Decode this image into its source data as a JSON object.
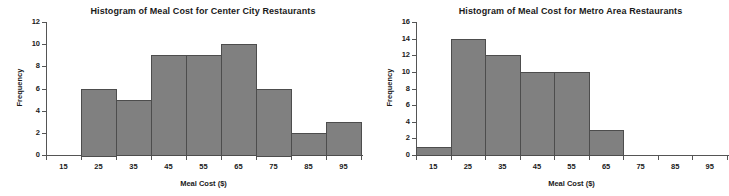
{
  "figure": {
    "panel_count": 2
  },
  "chart_data": [
    {
      "type": "bar",
      "title": "Histogram of Meal Cost for Center City Restaurants",
      "xlabel": "Meal Cost ($)",
      "ylabel": "Frequency",
      "categories": [
        "15",
        "25",
        "35",
        "45",
        "55",
        "65",
        "75",
        "85",
        "95"
      ],
      "bin_edges": [
        10,
        20,
        30,
        40,
        50,
        60,
        70,
        80,
        90,
        100
      ],
      "values": [
        0,
        6,
        5,
        9,
        9,
        10,
        6,
        2,
        3
      ],
      "xlim": [
        10,
        100
      ],
      "ylim": [
        0,
        12
      ],
      "ytick_values": [
        "0",
        "2",
        "4",
        "6",
        "8",
        "10",
        "12"
      ],
      "ytick_step": 2,
      "grid": false,
      "legend": false,
      "bar_color": "#808080",
      "bar_edge_color": "#4d4d4d",
      "axis_color": "#555555"
    },
    {
      "type": "bar",
      "title": "Histogram of Meal Cost for Metro Area Restaurants",
      "xlabel": "Meal Cost ($)",
      "ylabel": "Frequency",
      "categories": [
        "15",
        "25",
        "35",
        "45",
        "55",
        "65",
        "75",
        "85",
        "95"
      ],
      "bin_edges": [
        10,
        20,
        30,
        40,
        50,
        60,
        70,
        80,
        90,
        100
      ],
      "values": [
        1,
        14,
        12,
        10,
        10,
        3,
        0,
        0,
        0
      ],
      "xlim": [
        10,
        100
      ],
      "ylim": [
        0,
        16
      ],
      "ytick_values": [
        "0",
        "2",
        "4",
        "6",
        "8",
        "10",
        "12",
        "14",
        "16"
      ],
      "ytick_step": 2,
      "grid": false,
      "legend": false,
      "bar_color": "#808080",
      "bar_edge_color": "#4d4d4d",
      "axis_color": "#555555"
    }
  ]
}
